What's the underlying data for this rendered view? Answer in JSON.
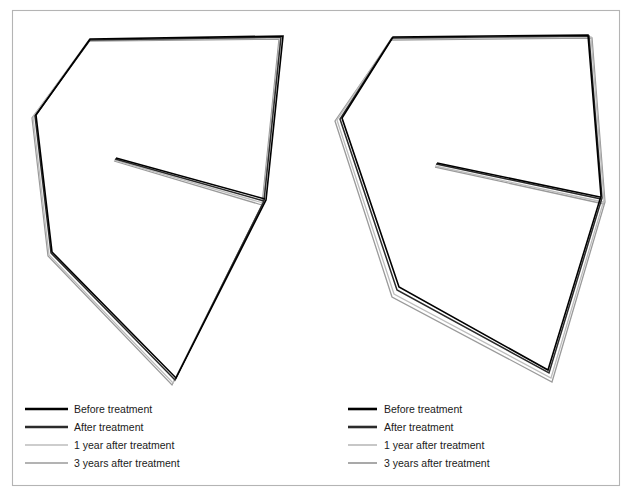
{
  "figure": {
    "background_color": "#ffffff",
    "frame_color": "#b4b4b4",
    "panel_count": 2
  },
  "series_styles": [
    {
      "key": "before",
      "label": "Before treatment",
      "color": "#000000",
      "width": 1.6
    },
    {
      "key": "after",
      "label": "After treatment",
      "color": "#2b2b2b",
      "width": 1.5
    },
    {
      "key": "year1",
      "label": "1 year after treatment",
      "color": "#bdbdbd",
      "width": 1.3
    },
    {
      "key": "year3",
      "label": "3 years after treatment",
      "color": "#9a9a9a",
      "width": 1.3
    }
  ],
  "panels": [
    {
      "name": "left-panel",
      "legend": {
        "name": "left-legend",
        "swatch_x1": 25,
        "swatch_x2": 68,
        "text_x": 74,
        "first_y": 409,
        "row_step": 18,
        "entries": [
          "Before treatment",
          "After treatment",
          "1 year after treatment",
          "3 years after treatment"
        ]
      }
    },
    {
      "name": "right-panel",
      "legend": {
        "name": "right-legend",
        "swatch_x1": 348,
        "swatch_x2": 377,
        "text_x": 384,
        "first_y": 409,
        "row_step": 18,
        "entries": [
          "Before treatment",
          "After treatment",
          "1 year after treatment",
          "3 years after treatment"
        ]
      }
    }
  ],
  "chart_data": {
    "type": "line",
    "subtitle": "",
    "xlabel": "",
    "ylabel": "",
    "grid": false,
    "legend_position": "bottom-left-of-each-panel",
    "xlim": [
      0,
      632
    ],
    "ylim": [
      0,
      500
    ],
    "note": "Two mirrored polygonal arch tracings; each panel overlays four time-point outlines plus an internal reference line.",
    "panels": [
      {
        "name": "left-panel",
        "series": [
          {
            "name": "Before treatment",
            "color": "#000000",
            "outline": [
              [
                90,
                39
              ],
              [
                283,
                36
              ],
              [
                266,
                200
              ],
              [
                176,
                378
              ],
              [
                52,
                252
              ],
              [
                36,
                115
              ]
            ],
            "inner_line": [
              [
                116,
                158
              ],
              [
                265,
                199
              ]
            ]
          },
          {
            "name": "After treatment",
            "color": "#2b2b2b",
            "outline": [
              [
                90,
                40
              ],
              [
                281,
                37
              ],
              [
                264,
                201
              ],
              [
                175,
                380
              ],
              [
                51,
                253
              ],
              [
                35,
                116
              ]
            ],
            "inner_line": [
              [
                115,
                159
              ],
              [
                264,
                201
              ]
            ]
          },
          {
            "name": "1 year after treatment",
            "color": "#bdbdbd",
            "outline": [
              [
                89,
                40
              ],
              [
                280,
                38
              ],
              [
                263,
                203
              ],
              [
                173,
                383
              ],
              [
                49,
                255
              ],
              [
                33,
                117
              ]
            ],
            "inner_line": [
              [
                114,
                160
              ],
              [
                263,
                203
              ]
            ]
          },
          {
            "name": "3 years after treatment",
            "color": "#9a9a9a",
            "outline": [
              [
                89,
                41
              ],
              [
                279,
                39
              ],
              [
                262,
                205
              ],
              [
                172,
                385
              ],
              [
                48,
                256
              ],
              [
                32,
                118
              ]
            ],
            "inner_line": [
              [
                114,
                161
              ],
              [
                262,
                205
              ]
            ]
          }
        ]
      },
      {
        "name": "right-panel",
        "series": [
          {
            "name": "Before treatment",
            "color": "#000000",
            "outline": [
              [
                393,
                37
              ],
              [
                588,
                35
              ],
              [
                601,
                196
              ],
              [
                548,
                370
              ],
              [
                399,
                287
              ],
              [
                342,
                118
              ]
            ],
            "inner_line": [
              [
                437,
                163
              ],
              [
                600,
                197
              ]
            ]
          },
          {
            "name": "After treatment",
            "color": "#2b2b2b",
            "outline": [
              [
                392,
                38
              ],
              [
                589,
                36
              ],
              [
                602,
                198
              ],
              [
                549,
                373
              ],
              [
                397,
                290
              ],
              [
                340,
                119
              ]
            ],
            "inner_line": [
              [
                436,
                164
              ],
              [
                601,
                199
              ]
            ]
          },
          {
            "name": "1 year after treatment",
            "color": "#bdbdbd",
            "outline": [
              [
                391,
                39
              ],
              [
                591,
                37
              ],
              [
                604,
                200
              ],
              [
                551,
                378
              ],
              [
                394,
                294
              ],
              [
                337,
                120
              ]
            ],
            "inner_line": [
              [
                435,
                166
              ],
              [
                603,
                202
              ]
            ]
          },
          {
            "name": "3 years after treatment",
            "color": "#9a9a9a",
            "outline": [
              [
                391,
                40
              ],
              [
                592,
                38
              ],
              [
                605,
                202
              ],
              [
                552,
                382
              ],
              [
                392,
                297
              ],
              [
                335,
                121
              ]
            ],
            "inner_line": [
              [
                435,
                167
              ],
              [
                604,
                204
              ]
            ]
          }
        ]
      }
    ]
  }
}
